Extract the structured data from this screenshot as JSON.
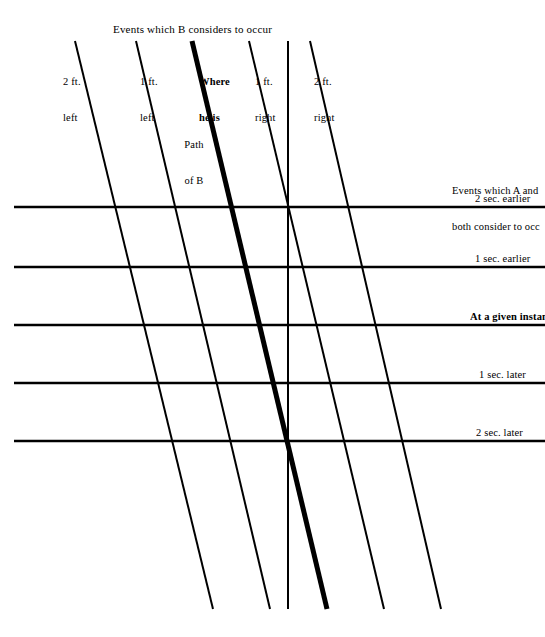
{
  "diagram": {
    "title": "Events which B considers to occur",
    "right_note_line1": "Events which A and",
    "right_note_line2": "both consider to occ",
    "path_label_line1": "Path",
    "path_label_line2": "of B",
    "worldline_labels": [
      {
        "line1": "2 ft.",
        "line2": "left"
      },
      {
        "line1": "1 ft.",
        "line2": "left"
      },
      {
        "line1": "Where",
        "line2": "he is"
      },
      {
        "line1": "1 ft.",
        "line2": "right"
      },
      {
        "line1": "2 ft.",
        "line2": "right"
      }
    ],
    "time_labels": [
      {
        "text": "2 sec. earlier",
        "bold": "false"
      },
      {
        "text": "1 sec. earlier",
        "bold": "false"
      },
      {
        "text": "At a given instan",
        "bold": "true"
      },
      {
        "text": "1 sec. later",
        "bold": "false"
      },
      {
        "text": "2 sec. later",
        "bold": "false"
      }
    ],
    "colors": {
      "ink": "#000000",
      "background": "#ffffff"
    },
    "geometry": {
      "horizontal_line_y": [
        207,
        267,
        325,
        383,
        441
      ],
      "horizontal_line_x_start": 14,
      "horizontal_line_x_end": 545,
      "diagonal_top_y": 41,
      "diagonal_bottom_y": 609,
      "diagonal_top_x": [
        75,
        136,
        192,
        249,
        310
      ],
      "diagonal_bottom_x": [
        213,
        270,
        327,
        384,
        441
      ],
      "bold_line_index": 2,
      "vertical_line_x": 288,
      "vertical_top_y": 41,
      "vertical_bottom_y": 609,
      "thin_stroke_width": 2,
      "bold_stroke_width": 5,
      "horizontal_stroke_width": 2.6
    }
  }
}
